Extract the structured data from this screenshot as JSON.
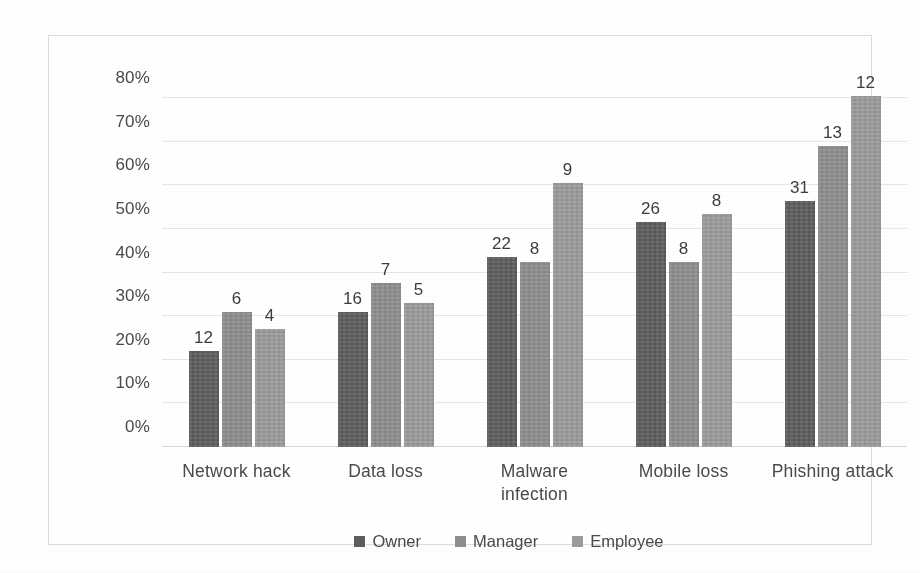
{
  "chart_data": {
    "type": "bar",
    "title": "",
    "xlabel": "",
    "ylabel": "",
    "ylim": [
      0,
      80
    ],
    "grid": true,
    "legend_position": "bottom",
    "categories": [
      "Network hack",
      "Data loss",
      "Malware infection",
      "Mobile loss",
      "Phishing attack"
    ],
    "ytick_labels": [
      "0%",
      "10%",
      "20%",
      "30%",
      "40%",
      "50%",
      "60%",
      "70%",
      "80%"
    ],
    "ytick_values": [
      0,
      10,
      20,
      30,
      40,
      50,
      60,
      70,
      80
    ],
    "series": [
      {
        "name": "Owner",
        "color": "#5d5d5d",
        "values": [
          22,
          31,
          43.5,
          51.5,
          56.5
        ],
        "point_labels": [
          "12",
          "16",
          "22",
          "26",
          "31"
        ]
      },
      {
        "name": "Manager",
        "color": "#8e8e8e",
        "values": [
          31,
          37.5,
          42.5,
          42.5,
          69
        ],
        "point_labels": [
          "6",
          "7",
          "8",
          "8",
          "13"
        ]
      },
      {
        "name": "Employee",
        "color": "#9b9b9b",
        "values": [
          27,
          33,
          60.5,
          53.5,
          80.5
        ],
        "point_labels": [
          "4",
          "5",
          "9",
          "8",
          "12"
        ]
      }
    ]
  },
  "category_label_lines": [
    [
      "Network hack"
    ],
    [
      "Data loss"
    ],
    [
      "Malware",
      "infection"
    ],
    [
      "Mobile loss"
    ],
    [
      "Phishing attack"
    ]
  ]
}
